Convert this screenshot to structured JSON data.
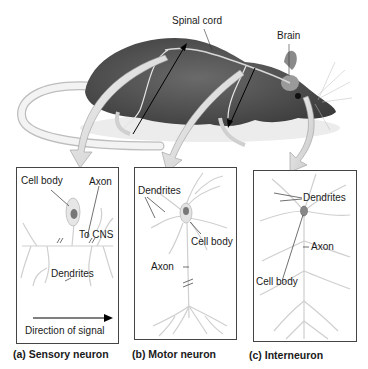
{
  "figure": {
    "rat_labels": {
      "spinal_cord": "Spinal cord",
      "brain": "Brain"
    },
    "panels": [
      {
        "id": "a",
        "caption": "(a) Sensory neuron",
        "labels": {
          "cell_body": "Cell body",
          "axon": "Axon",
          "to_cns": "To CNS",
          "dendrites": "Dendrites",
          "direction": "Direction of signal"
        }
      },
      {
        "id": "b",
        "caption": "(b) Motor neuron",
        "labels": {
          "dendrites": "Dendrites",
          "cell_body": "Cell body",
          "axon": "Axon"
        }
      },
      {
        "id": "c",
        "caption": "(c) Interneuron",
        "labels": {
          "dendrites": "Dendrites",
          "axon": "Axon",
          "cell_body": "Cell body"
        }
      }
    ],
    "colors": {
      "rat_fur": "#5a5a5a",
      "rat_fur_dark": "#3a3a3a",
      "tail": "#efefef",
      "callout_arrow": "#d8d8d8",
      "neuron": "#cfcfcf",
      "box_border": "#444444"
    }
  }
}
